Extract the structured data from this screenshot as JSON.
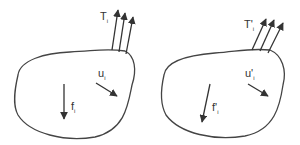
{
  "diagram": {
    "stroke_color": "#444444",
    "bodies": [
      {
        "name": "original-state",
        "traction_label": "T",
        "traction_sub": "i",
        "displacement_label": "u",
        "displacement_sub": "i",
        "body_force_label": "f",
        "body_force_sub": "i"
      },
      {
        "name": "alternate-state",
        "traction_label": "T'",
        "traction_sub": "i",
        "displacement_label": "u'",
        "displacement_sub": "i",
        "body_force_label": "f'",
        "body_force_sub": "i"
      }
    ]
  }
}
